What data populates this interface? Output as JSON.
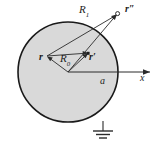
{
  "figure": {
    "type": "physics-diagram",
    "colors": {
      "sphere_fill": "#d9d9d9",
      "sphere_stroke": "#1a1a1a",
      "line_stroke": "#2b2b2b",
      "label_color": "#1c1c1c",
      "background": "#ffffff"
    },
    "geometry": {
      "circle_center_x": 68,
      "circle_center_y": 72,
      "circle_radius": 50,
      "origin_x": 68,
      "origin_y": 72,
      "point_r_x": 47,
      "point_r_y": 56,
      "point_rprime_x": 88,
      "point_rprime_y": 53,
      "point_rdprime_x": 117,
      "point_rdprime_y": 14,
      "axis_end_x": 152,
      "ground_x": 103,
      "ground_top_y": 121,
      "ground_bottom_y": 140
    }
  },
  "labels": {
    "R_upper": "R",
    "R_upper_sub": "1",
    "R_lower": "R",
    "R_lower_sub": "0",
    "r": "r",
    "r_prime": "r′",
    "r_double_prime": "r″",
    "radius": "a",
    "axis": "x"
  }
}
